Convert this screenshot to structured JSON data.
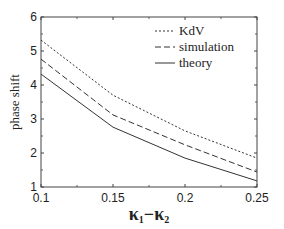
{
  "chart_data": {
    "type": "line",
    "title": "",
    "xlabel": "κ1−κ2",
    "xlabel_parts": {
      "main1": "κ",
      "sub1": "1",
      "minus": "−",
      "main2": "κ",
      "sub2": "2"
    },
    "ylabel": "phase shift",
    "x": [
      0.1,
      0.15,
      0.2,
      0.25
    ],
    "xlim": [
      0.1,
      0.25
    ],
    "ylim": [
      1,
      6
    ],
    "xticks": [
      "0.1",
      "0.15",
      "0.2",
      "0.25"
    ],
    "yticks": [
      "1",
      "2",
      "3",
      "4",
      "5",
      "6"
    ],
    "grid": false,
    "legend_position": "upper right",
    "series": [
      {
        "name": "KdV",
        "style": "dotted",
        "values": [
          5.32,
          3.7,
          2.65,
          1.85
        ]
      },
      {
        "name": "simulation",
        "style": "dashed",
        "values": [
          4.76,
          3.12,
          2.24,
          1.44
        ]
      },
      {
        "name": "theory",
        "style": "solid",
        "values": [
          4.32,
          2.76,
          1.85,
          1.18
        ]
      }
    ]
  }
}
